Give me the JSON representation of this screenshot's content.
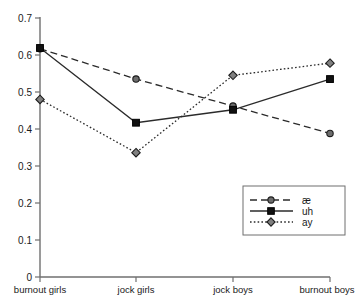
{
  "chart_data": {
    "type": "line",
    "title": "",
    "xlabel": "",
    "ylabel": "",
    "categories": [
      "burnout girls",
      "jock girls",
      "jock boys",
      "burnout boys"
    ],
    "ylim": [
      0,
      0.7
    ],
    "yticks": [
      0,
      0.1,
      0.2,
      0.3,
      0.4,
      0.5,
      0.6,
      0.7
    ],
    "ytick_labels": [
      "0",
      "0.1",
      "0.2",
      "0.3",
      "0.4",
      "0.5",
      "0.6",
      "0.7"
    ],
    "grid": false,
    "legend_position": "lower right",
    "series": [
      {
        "name": "ae",
        "label": "æ",
        "values": [
          0.617,
          0.535,
          0.462,
          0.388
        ],
        "linestyle": "dashed",
        "marker": "circle",
        "color": "#6d6d6d"
      },
      {
        "name": "uh",
        "label": "uh",
        "values": [
          0.619,
          0.417,
          0.452,
          0.535
        ],
        "linestyle": "solid",
        "marker": "square",
        "color": "#111111"
      },
      {
        "name": "ay",
        "label": "ay",
        "values": [
          0.48,
          0.336,
          0.545,
          0.578
        ],
        "linestyle": "dotted",
        "marker": "diamond",
        "color": "#808080"
      }
    ]
  },
  "axes": {
    "y_tick_0": "0",
    "y_tick_1": "0.1",
    "y_tick_2": "0.2",
    "y_tick_3": "0.3",
    "y_tick_4": "0.4",
    "y_tick_5": "0.5",
    "y_tick_6": "0.6",
    "y_tick_7": "0.7",
    "x_cat_0": "burnout girls",
    "x_cat_1": "jock girls",
    "x_cat_2": "jock boys",
    "x_cat_3": "burnout boys"
  },
  "legend": {
    "item_0": "æ",
    "item_1": "uh",
    "item_2": "ay"
  },
  "colors": {
    "axis": "#6f6f6f",
    "line": "#2b2b2b",
    "text": "#1a1a1a",
    "background": "#ffffff"
  }
}
